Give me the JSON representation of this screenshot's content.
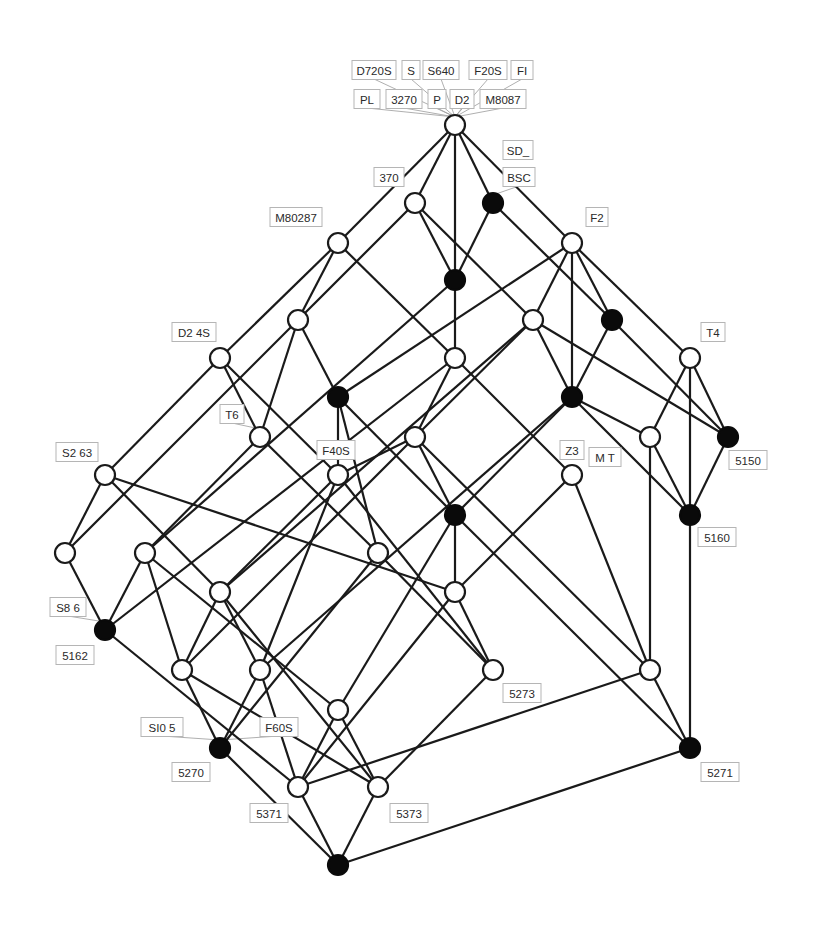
{
  "diagram": {
    "type": "concept-lattice",
    "node_radius": 10,
    "colors": {
      "edge": "#1a1a1a",
      "filled_node": "#0a0a0a",
      "open_node": "#ffffff",
      "label_border": "#b5b5b5",
      "label_text": "#2a2a2a"
    },
    "nodes": [
      {
        "id": "n0",
        "x": 455,
        "y": 125,
        "filled": false
      },
      {
        "id": "n1",
        "x": 415,
        "y": 203,
        "filled": false
      },
      {
        "id": "n2",
        "x": 493,
        "y": 203,
        "filled": true
      },
      {
        "id": "n3",
        "x": 338,
        "y": 243,
        "filled": false
      },
      {
        "id": "n4",
        "x": 572,
        "y": 243,
        "filled": false
      },
      {
        "id": "n5",
        "x": 455,
        "y": 280,
        "filled": true
      },
      {
        "id": "n6",
        "x": 298,
        "y": 320,
        "filled": false
      },
      {
        "id": "n7",
        "x": 533,
        "y": 320,
        "filled": false
      },
      {
        "id": "n8",
        "x": 612,
        "y": 320,
        "filled": true
      },
      {
        "id": "n9",
        "x": 220,
        "y": 358,
        "filled": false
      },
      {
        "id": "n10",
        "x": 455,
        "y": 358,
        "filled": false
      },
      {
        "id": "n11",
        "x": 690,
        "y": 358,
        "filled": false
      },
      {
        "id": "n12",
        "x": 338,
        "y": 397,
        "filled": true
      },
      {
        "id": "n13",
        "x": 572,
        "y": 397,
        "filled": true
      },
      {
        "id": "n14",
        "x": 260,
        "y": 437,
        "filled": false
      },
      {
        "id": "n15",
        "x": 415,
        "y": 437,
        "filled": false
      },
      {
        "id": "n16",
        "x": 650,
        "y": 437,
        "filled": false
      },
      {
        "id": "n17",
        "x": 728,
        "y": 437,
        "filled": true
      },
      {
        "id": "n18",
        "x": 105,
        "y": 475,
        "filled": false
      },
      {
        "id": "n19",
        "x": 338,
        "y": 475,
        "filled": false
      },
      {
        "id": "n20",
        "x": 572,
        "y": 475,
        "filled": false
      },
      {
        "id": "n21",
        "x": 455,
        "y": 515,
        "filled": true
      },
      {
        "id": "n22",
        "x": 690,
        "y": 515,
        "filled": true
      },
      {
        "id": "n23",
        "x": 65,
        "y": 553,
        "filled": false
      },
      {
        "id": "n24",
        "x": 145,
        "y": 553,
        "filled": false
      },
      {
        "id": "n25",
        "x": 378,
        "y": 553,
        "filled": false
      },
      {
        "id": "n26",
        "x": 220,
        "y": 592,
        "filled": false
      },
      {
        "id": "n27",
        "x": 455,
        "y": 592,
        "filled": false
      },
      {
        "id": "n28",
        "x": 105,
        "y": 630,
        "filled": true
      },
      {
        "id": "n29",
        "x": 182,
        "y": 670,
        "filled": false
      },
      {
        "id": "n30",
        "x": 260,
        "y": 670,
        "filled": false
      },
      {
        "id": "n31",
        "x": 493,
        "y": 670,
        "filled": false
      },
      {
        "id": "n32",
        "x": 650,
        "y": 670,
        "filled": false
      },
      {
        "id": "n33",
        "x": 338,
        "y": 710,
        "filled": false
      },
      {
        "id": "n34",
        "x": 220,
        "y": 748,
        "filled": true
      },
      {
        "id": "n35",
        "x": 690,
        "y": 748,
        "filled": true
      },
      {
        "id": "n36",
        "x": 298,
        "y": 787,
        "filled": false
      },
      {
        "id": "n37",
        "x": 378,
        "y": 787,
        "filled": false
      },
      {
        "id": "n38",
        "x": 338,
        "y": 865,
        "filled": true
      }
    ],
    "edges": [
      [
        "n0",
        "n1"
      ],
      [
        "n0",
        "n2"
      ],
      [
        "n0",
        "n3"
      ],
      [
        "n0",
        "n4"
      ],
      [
        "n0",
        "n5"
      ],
      [
        "n1",
        "n6"
      ],
      [
        "n1",
        "n5"
      ],
      [
        "n1",
        "n7"
      ],
      [
        "n2",
        "n5"
      ],
      [
        "n2",
        "n8"
      ],
      [
        "n3",
        "n9"
      ],
      [
        "n3",
        "n6"
      ],
      [
        "n3",
        "n10"
      ],
      [
        "n4",
        "n7"
      ],
      [
        "n4",
        "n8"
      ],
      [
        "n4",
        "n11"
      ],
      [
        "n4",
        "n12"
      ],
      [
        "n4",
        "n13"
      ],
      [
        "n5",
        "n10"
      ],
      [
        "n5",
        "n24"
      ],
      [
        "n6",
        "n12"
      ],
      [
        "n6",
        "n14"
      ],
      [
        "n6",
        "n23"
      ],
      [
        "n7",
        "n13"
      ],
      [
        "n7",
        "n15"
      ],
      [
        "n7",
        "n17"
      ],
      [
        "n7",
        "n26"
      ],
      [
        "n8",
        "n13"
      ],
      [
        "n8",
        "n17"
      ],
      [
        "n9",
        "n14"
      ],
      [
        "n9",
        "n18"
      ],
      [
        "n9",
        "n19"
      ],
      [
        "n10",
        "n15"
      ],
      [
        "n10",
        "n20"
      ],
      [
        "n10",
        "n28"
      ],
      [
        "n11",
        "n16"
      ],
      [
        "n11",
        "n17"
      ],
      [
        "n11",
        "n22"
      ],
      [
        "n12",
        "n19"
      ],
      [
        "n12",
        "n21"
      ],
      [
        "n12",
        "n25"
      ],
      [
        "n13",
        "n16"
      ],
      [
        "n13",
        "n22"
      ],
      [
        "n13",
        "n21"
      ],
      [
        "n13",
        "n30"
      ],
      [
        "n14",
        "n24"
      ],
      [
        "n14",
        "n25"
      ],
      [
        "n15",
        "n21"
      ],
      [
        "n15",
        "n19"
      ],
      [
        "n15",
        "n29"
      ],
      [
        "n15",
        "n32"
      ],
      [
        "n16",
        "n22"
      ],
      [
        "n16",
        "n32"
      ],
      [
        "n17",
        "n22"
      ],
      [
        "n18",
        "n23"
      ],
      [
        "n18",
        "n26"
      ],
      [
        "n18",
        "n27"
      ],
      [
        "n19",
        "n26"
      ],
      [
        "n19",
        "n30"
      ],
      [
        "n19",
        "n31"
      ],
      [
        "n20",
        "n27"
      ],
      [
        "n20",
        "n32"
      ],
      [
        "n21",
        "n27"
      ],
      [
        "n21",
        "n33"
      ],
      [
        "n21",
        "n35"
      ],
      [
        "n22",
        "n35"
      ],
      [
        "n23",
        "n28"
      ],
      [
        "n24",
        "n28"
      ],
      [
        "n24",
        "n29"
      ],
      [
        "n24",
        "n33"
      ],
      [
        "n25",
        "n31"
      ],
      [
        "n25",
        "n34"
      ],
      [
        "n26",
        "n29"
      ],
      [
        "n26",
        "n30"
      ],
      [
        "n26",
        "n37"
      ],
      [
        "n27",
        "n31"
      ],
      [
        "n27",
        "n36"
      ],
      [
        "n28",
        "n36"
      ],
      [
        "n29",
        "n34"
      ],
      [
        "n29",
        "n37"
      ],
      [
        "n30",
        "n34"
      ],
      [
        "n30",
        "n36"
      ],
      [
        "n31",
        "n37"
      ],
      [
        "n32",
        "n35"
      ],
      [
        "n32",
        "n36"
      ],
      [
        "n33",
        "n36"
      ],
      [
        "n33",
        "n37"
      ],
      [
        "n34",
        "n38"
      ],
      [
        "n35",
        "n38"
      ],
      [
        "n36",
        "n38"
      ],
      [
        "n37",
        "n38"
      ]
    ],
    "labels": [
      {
        "text": "D720S",
        "x": 374,
        "y": 70,
        "w": 44,
        "anchor": "n0"
      },
      {
        "text": "S",
        "x": 411,
        "y": 70,
        "w": 18,
        "anchor": "n0"
      },
      {
        "text": "S640",
        "x": 441,
        "y": 70,
        "w": 36,
        "anchor": "n0"
      },
      {
        "text": "F20S",
        "x": 488,
        "y": 70,
        "w": 38,
        "anchor": "n0"
      },
      {
        "text": "FI",
        "x": 522,
        "y": 70,
        "w": 22,
        "anchor": "n0"
      },
      {
        "text": "PL",
        "x": 367,
        "y": 99,
        "w": 26,
        "anchor": "n0"
      },
      {
        "text": "3270",
        "x": 404,
        "y": 99,
        "w": 36,
        "anchor": "n0"
      },
      {
        "text": "P",
        "x": 437,
        "y": 99,
        "w": 18,
        "anchor": "n0"
      },
      {
        "text": "D2",
        "x": 462,
        "y": 99,
        "w": 24,
        "anchor": "n0"
      },
      {
        "text": "M8087",
        "x": 503,
        "y": 99,
        "w": 46,
        "anchor": "n0"
      },
      {
        "text": "SD_",
        "x": 518,
        "y": 150,
        "w": 30,
        "anchor": null
      },
      {
        "text": "BSC",
        "x": 519,
        "y": 177,
        "w": 32,
        "anchor": "n2"
      },
      {
        "text": "370",
        "x": 389,
        "y": 177,
        "w": 30,
        "anchor": null
      },
      {
        "text": "M80287",
        "x": 296,
        "y": 217,
        "w": 52,
        "anchor": null
      },
      {
        "text": "F2",
        "x": 597,
        "y": 217,
        "w": 22,
        "anchor": null
      },
      {
        "text": "D2 4S",
        "x": 194,
        "y": 332,
        "w": 44,
        "anchor": null
      },
      {
        "text": "T4",
        "x": 713,
        "y": 332,
        "w": 24,
        "anchor": null
      },
      {
        "text": "T6",
        "x": 232,
        "y": 414,
        "w": 24,
        "anchor": "n14"
      },
      {
        "text": "S2 63",
        "x": 77,
        "y": 452,
        "w": 42,
        "anchor": null
      },
      {
        "text": "F40S",
        "x": 336,
        "y": 450,
        "w": 38,
        "anchor": null
      },
      {
        "text": "Z3",
        "x": 572,
        "y": 450,
        "w": 24,
        "anchor": null
      },
      {
        "text": "M T",
        "x": 605,
        "y": 457,
        "w": 32,
        "anchor": null
      },
      {
        "text": "5150",
        "x": 748,
        "y": 460,
        "w": 38,
        "anchor": null
      },
      {
        "text": "5160",
        "x": 717,
        "y": 537,
        "w": 38,
        "anchor": null
      },
      {
        "text": "S8 6",
        "x": 68,
        "y": 607,
        "w": 36,
        "anchor": "n28"
      },
      {
        "text": "5162",
        "x": 75,
        "y": 655,
        "w": 38,
        "anchor": null
      },
      {
        "text": "5273",
        "x": 522,
        "y": 693,
        "w": 38,
        "anchor": null
      },
      {
        "text": "SI0 5",
        "x": 162,
        "y": 727,
        "w": 42,
        "anchor": "n34"
      },
      {
        "text": "F60S",
        "x": 279,
        "y": 727,
        "w": 38,
        "anchor": "n34"
      },
      {
        "text": "5270",
        "x": 191,
        "y": 772,
        "w": 38,
        "anchor": null
      },
      {
        "text": "5371",
        "x": 269,
        "y": 813,
        "w": 38,
        "anchor": null
      },
      {
        "text": "5373",
        "x": 409,
        "y": 813,
        "w": 38,
        "anchor": null
      },
      {
        "text": "5271",
        "x": 720,
        "y": 772,
        "w": 38,
        "anchor": null
      }
    ]
  }
}
